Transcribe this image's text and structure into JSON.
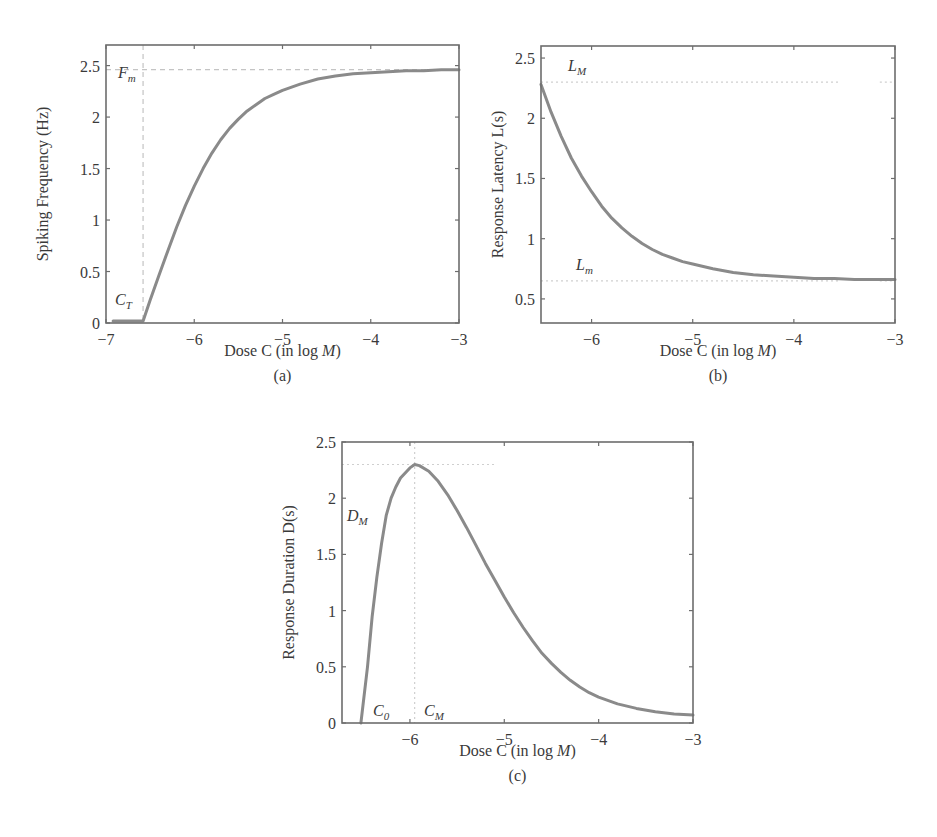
{
  "chart_data": [
    {
      "id": "a",
      "type": "line",
      "panel_label": "(a)",
      "title": "",
      "xlabel": "Dose C (in log M)",
      "ylabel": "Spiking Frequency (Hz)",
      "xlim": [
        -7,
        -3
      ],
      "ylim": [
        0,
        2.7
      ],
      "xticks": [
        -7,
        -6,
        -5,
        -4,
        -3
      ],
      "xtick_labels": [
        "−7",
        "−6",
        "−5",
        "−4",
        "−3"
      ],
      "yticks": [
        0,
        0.5,
        1,
        1.5,
        2,
        2.5
      ],
      "ytick_labels": [
        "0",
        "0.5",
        "1",
        "1.5",
        "2",
        "2.5"
      ],
      "grid": false,
      "annotations": [
        {
          "text": "F",
          "sub": "m",
          "meaning": "max frequency",
          "y": 2.46
        },
        {
          "text": "C",
          "sub": "T",
          "meaning": "threshold dose",
          "x": -6.58
        }
      ],
      "reference_lines": [
        {
          "orientation": "horizontal",
          "value": 2.46,
          "style": "dashed"
        },
        {
          "orientation": "vertical",
          "value": -6.58,
          "style": "dashed"
        }
      ],
      "series": [
        {
          "name": "Spiking frequency",
          "x": [
            -6.92,
            -6.58,
            -6.5,
            -6.4,
            -6.3,
            -6.2,
            -6.1,
            -6.0,
            -5.9,
            -5.8,
            -5.7,
            -5.6,
            -5.5,
            -5.4,
            -5.3,
            -5.2,
            -5.1,
            -5.0,
            -4.8,
            -4.6,
            -4.4,
            -4.2,
            -4.0,
            -3.8,
            -3.6,
            -3.4,
            -3.2,
            -3.0
          ],
          "y": [
            0.02,
            0.02,
            0.22,
            0.46,
            0.7,
            0.93,
            1.14,
            1.33,
            1.5,
            1.65,
            1.78,
            1.89,
            1.98,
            2.06,
            2.12,
            2.18,
            2.22,
            2.26,
            2.32,
            2.37,
            2.4,
            2.42,
            2.43,
            2.44,
            2.45,
            2.45,
            2.46,
            2.46
          ]
        }
      ]
    },
    {
      "id": "b",
      "type": "line",
      "panel_label": "(b)",
      "title": "",
      "xlabel": "Dose C (in log M)",
      "ylabel": "Response Latency L(s)",
      "xlim": [
        -6.5,
        -3
      ],
      "ylim": [
        0.3,
        2.6
      ],
      "xticks": [
        -6,
        -5,
        -4,
        -3
      ],
      "xtick_labels": [
        "−6",
        "−5",
        "−4",
        "−3"
      ],
      "yticks": [
        0.5,
        1,
        1.5,
        2,
        2.5
      ],
      "ytick_labels": [
        "0.5",
        "1",
        "1.5",
        "2",
        "2.5"
      ],
      "grid": false,
      "annotations": [
        {
          "text": "L",
          "sub": "M",
          "meaning": "max latency",
          "y": 2.3
        },
        {
          "text": "L",
          "sub": "m",
          "meaning": "min latency",
          "y": 0.65
        }
      ],
      "reference_lines": [
        {
          "orientation": "horizontal",
          "value": 2.3,
          "style": "dotted"
        },
        {
          "orientation": "horizontal",
          "value": 0.65,
          "style": "dotted"
        }
      ],
      "series": [
        {
          "name": "Response latency",
          "x": [
            -6.5,
            -6.4,
            -6.3,
            -6.2,
            -6.1,
            -6.0,
            -5.9,
            -5.8,
            -5.7,
            -5.6,
            -5.5,
            -5.4,
            -5.3,
            -5.2,
            -5.1,
            -5.0,
            -4.8,
            -4.6,
            -4.4,
            -4.2,
            -4.0,
            -3.8,
            -3.6,
            -3.4,
            -3.2,
            -3.0
          ],
          "y": [
            2.28,
            2.05,
            1.85,
            1.67,
            1.52,
            1.39,
            1.27,
            1.17,
            1.09,
            1.02,
            0.96,
            0.91,
            0.87,
            0.84,
            0.81,
            0.79,
            0.75,
            0.72,
            0.7,
            0.69,
            0.68,
            0.67,
            0.67,
            0.66,
            0.66,
            0.66
          ]
        }
      ]
    },
    {
      "id": "c",
      "type": "line",
      "panel_label": "(c)",
      "title": "",
      "xlabel": "Dose C (in log M)",
      "ylabel": "Response Duration D(s)",
      "xlim": [
        -6.72,
        -3
      ],
      "ylim": [
        0,
        2.5
      ],
      "xticks": [
        -6,
        -5,
        -4,
        -3
      ],
      "xtick_labels": [
        "−6",
        "−5",
        "−4",
        "−3"
      ],
      "yticks": [
        0,
        0.5,
        1,
        1.5,
        2,
        2.5
      ],
      "ytick_labels": [
        "0",
        "0.5",
        "1",
        "1.5",
        "2",
        "2.5"
      ],
      "grid": false,
      "annotations": [
        {
          "text": "D",
          "sub": "M",
          "meaning": "max duration",
          "y": 2.3
        },
        {
          "text": "C",
          "sub": "0",
          "meaning": "onset dose",
          "x": -6.52
        },
        {
          "text": "C",
          "sub": "M",
          "meaning": "dose at max duration",
          "x": -5.95
        }
      ],
      "reference_lines": [
        {
          "orientation": "horizontal",
          "value": 2.3,
          "style": "dotted"
        },
        {
          "orientation": "vertical",
          "value": -5.95,
          "style": "dotted"
        }
      ],
      "series": [
        {
          "name": "Response duration",
          "x": [
            -6.52,
            -6.45,
            -6.4,
            -6.35,
            -6.3,
            -6.25,
            -6.2,
            -6.15,
            -6.1,
            -6.0,
            -5.95,
            -5.9,
            -5.8,
            -5.7,
            -5.6,
            -5.5,
            -5.4,
            -5.3,
            -5.2,
            -5.1,
            -5.0,
            -4.9,
            -4.8,
            -4.7,
            -4.6,
            -4.5,
            -4.4,
            -4.3,
            -4.2,
            -4.1,
            -4.0,
            -3.8,
            -3.6,
            -3.4,
            -3.2,
            -3.0
          ],
          "y": [
            0.0,
            0.5,
            0.95,
            1.3,
            1.6,
            1.85,
            2.0,
            2.1,
            2.18,
            2.27,
            2.3,
            2.29,
            2.24,
            2.15,
            2.03,
            1.89,
            1.74,
            1.58,
            1.42,
            1.27,
            1.12,
            0.98,
            0.85,
            0.73,
            0.62,
            0.53,
            0.45,
            0.38,
            0.32,
            0.27,
            0.23,
            0.17,
            0.13,
            0.1,
            0.08,
            0.07
          ]
        }
      ]
    }
  ],
  "panels": {
    "a": {
      "label": "(a)",
      "xlabel": "Dose C (in log M)",
      "ylabel": "Spiking Frequency (Hz)"
    },
    "b": {
      "label": "(b)",
      "xlabel": "Dose C (in log M)",
      "ylabel": "Response Latency L(s)"
    },
    "c": {
      "label": "(c)",
      "xlabel": "Dose C (in log M)",
      "ylabel": "Response Duration D(s)"
    }
  },
  "style": {
    "curve_color": "#8a8a8a",
    "frame_color": "#6d6d6d",
    "reference_color": "#c4c4c4",
    "text_color": "#3a3a3a"
  }
}
